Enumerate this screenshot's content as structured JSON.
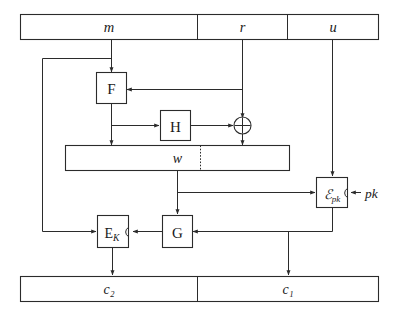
{
  "diagram": {
    "background_color": "#ffffff",
    "line_color": "#2b2b2b",
    "text_color": "#1a1a1a"
  },
  "input_bar": {
    "name": "input-register",
    "fields": [
      {
        "id": "m",
        "label": "m",
        "style": "italic"
      },
      {
        "id": "r",
        "label": "r",
        "style": "italic"
      },
      {
        "id": "u",
        "label": "u",
        "style": "italic"
      }
    ]
  },
  "output_bar": {
    "name": "output-register",
    "fields": [
      {
        "id": "c2",
        "label": "c₂",
        "style": "italic"
      },
      {
        "id": "c1",
        "label": "c₁",
        "style": "italic"
      }
    ]
  },
  "middle_bar": {
    "name": "intermediate-register",
    "label": "w",
    "style": "italic"
  },
  "blocks": [
    {
      "id": "F",
      "label": "F",
      "style": "upright",
      "name": "block-f"
    },
    {
      "id": "H",
      "label": "H",
      "style": "upright",
      "name": "block-h"
    },
    {
      "id": "G",
      "label": "G",
      "style": "upright",
      "name": "block-g"
    },
    {
      "id": "EK",
      "label": "Eₖ",
      "style": "upright",
      "name": "block-ek"
    },
    {
      "id": "Epk",
      "label": "ℰₚₖ",
      "style": "italic",
      "name": "block-epk"
    }
  ],
  "operators": [
    {
      "id": "xor",
      "symbol": "⊕",
      "name": "xor-gate"
    }
  ],
  "side_labels": [
    {
      "id": "pk",
      "label": "pk",
      "style": "italic",
      "name": "label-pk"
    }
  ],
  "block_glyphs": {
    "F": "F",
    "H": "H",
    "G": "G",
    "EK_base": "E",
    "EK_sub": "K",
    "Epk_base": "ℰ",
    "Epk_sub": "pk",
    "xor": "⊕"
  }
}
